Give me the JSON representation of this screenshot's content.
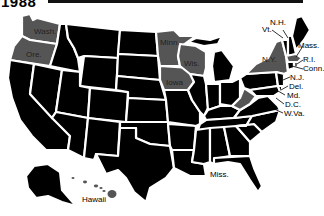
{
  "title": "1988",
  "colors": {
    "default_state": "#000000",
    "highlighted_state": "#555555",
    "border": "#ffffff",
    "background": "#ffffff"
  },
  "highlighted_states": [
    "Wash.",
    "Ore.",
    "Minn.",
    "Wis.",
    "Iowa",
    "N.Y.",
    "W.Va.",
    "Mass.",
    "R.I.",
    "Hawaii"
  ],
  "labels": {
    "wash": "Wash.",
    "ore": "Ore.",
    "minn": "Minn.",
    "wis": "Wis.",
    "iowa": "Iowa",
    "ny": "N.Y.",
    "vt": "Vt.",
    "nh": "N.H.",
    "mass": "Mass.",
    "ri": "R.I.",
    "conn": "Conn.",
    "nj": "N.J.",
    "del": "Del.",
    "md": "Md.",
    "dc": "D.C.",
    "wva": "W.Va.",
    "miss": "Miss.",
    "hawaii": "Hawaii"
  }
}
